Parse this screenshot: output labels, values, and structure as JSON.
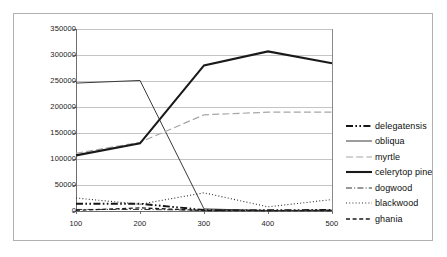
{
  "chart_data": {
    "type": "line",
    "title": "",
    "xlabel": "",
    "ylabel": "",
    "x": [
      100,
      200,
      300,
      400,
      500
    ],
    "xticks": [
      "100",
      "200",
      "300",
      "400",
      "500"
    ],
    "yticks": [
      "0",
      "50000",
      "100000",
      "150000",
      "200000",
      "250000",
      "300000",
      "350000"
    ],
    "ylim": [
      0,
      350000
    ],
    "xlim": [
      100,
      500
    ],
    "grid": "horizontal",
    "legend_position": "right",
    "series": [
      {
        "name": "delegatensis",
        "values": [
          14000,
          14000,
          2000,
          1500,
          2000
        ],
        "color": "#141414",
        "style": "dash-dot-dot",
        "width": 1.9
      },
      {
        "name": "obliqua",
        "values": [
          246000,
          251000,
          4000,
          1000,
          1000
        ],
        "color": "#3a3a3a",
        "style": "solid",
        "width": 1.0
      },
      {
        "name": "myrtle",
        "values": [
          111000,
          132000,
          185000,
          190000,
          190000
        ],
        "color": "#a6a6a6",
        "style": "long-dash",
        "width": 1.2
      },
      {
        "name": "celerytop pine",
        "values": [
          107000,
          130000,
          280000,
          307000,
          284000
        ],
        "color": "#1a1a1a",
        "style": "solid",
        "width": 2.1
      },
      {
        "name": "dogwood",
        "values": [
          3000,
          3000,
          1500,
          1000,
          1500
        ],
        "color": "#333333",
        "style": "dash-dot",
        "width": 1.0
      },
      {
        "name": "blackwood",
        "values": [
          25000,
          13000,
          35000,
          8000,
          22000
        ],
        "color": "#2e2e2e",
        "style": "dotted",
        "width": 1.1
      },
      {
        "name": "ghania",
        "values": [
          1200,
          6000,
          1000,
          800,
          1000
        ],
        "color": "#1a1a1a",
        "style": "dashed",
        "width": 1.3
      }
    ]
  },
  "legend": {
    "items": [
      {
        "label": "delegatensis"
      },
      {
        "label": "obliqua"
      },
      {
        "label": "myrtle"
      },
      {
        "label": "celerytop pine"
      },
      {
        "label": "dogwood"
      },
      {
        "label": "blackwood"
      },
      {
        "label": "ghania"
      }
    ]
  }
}
